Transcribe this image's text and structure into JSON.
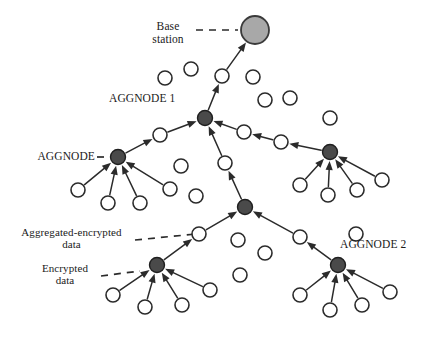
{
  "figure": {
    "type": "diagram",
    "background_color": "#ffffff",
    "stroke_color": "#2b2b2b",
    "sensor_node_fill": "#ffffff",
    "aggregator_node_fill": "#4a4a4a",
    "base_station_fill": "#a8a8a8"
  },
  "labels": {
    "base_station": {
      "line1": "Base",
      "line2": "station"
    },
    "aggnode_1": "AGGNODE 1",
    "aggnode": "AGGNODE",
    "aggnode_2": "AGGNODE 2",
    "aggregated_encrypted": {
      "line1": "Aggregated-encrypted",
      "line2": "data"
    },
    "encrypted": {
      "line1": "Encrypted",
      "line2": "data"
    }
  },
  "nodes": {
    "base_station": {
      "x": 255,
      "y": 30,
      "r": 14,
      "kind": "base-station"
    },
    "aggregators": [
      {
        "id": "aggnode1",
        "x": 205,
        "y": 118,
        "r": 7.5
      },
      {
        "id": "aggnode_left",
        "x": 118,
        "y": 157,
        "r": 7.5
      },
      {
        "id": "aggnode_right",
        "x": 330,
        "y": 152,
        "r": 7.5
      },
      {
        "id": "aggnode_center",
        "x": 245,
        "y": 207,
        "r": 7.5
      },
      {
        "id": "aggnode_bottom_left",
        "x": 157,
        "y": 265,
        "r": 7.5
      },
      {
        "id": "aggnode2",
        "x": 338,
        "y": 265,
        "r": 7.5
      }
    ],
    "relays": [
      {
        "id": "r_bs",
        "x": 222,
        "y": 76,
        "r": 7
      },
      {
        "id": "r_left_up",
        "x": 160,
        "y": 135,
        "r": 7
      },
      {
        "id": "r_right_a",
        "x": 244,
        "y": 132,
        "r": 7
      },
      {
        "id": "r_right_b",
        "x": 281,
        "y": 142,
        "r": 7
      },
      {
        "id": "r_center_up",
        "x": 225,
        "y": 163,
        "r": 7
      },
      {
        "id": "r_bl",
        "x": 199,
        "y": 234,
        "r": 7
      },
      {
        "id": "r_br",
        "x": 300,
        "y": 237,
        "r": 7
      }
    ],
    "sensors": [
      {
        "x": 165,
        "y": 78,
        "r": 7
      },
      {
        "x": 191,
        "y": 69,
        "r": 7
      },
      {
        "x": 253,
        "y": 77,
        "r": 7
      },
      {
        "x": 265,
        "y": 100,
        "r": 7
      },
      {
        "x": 290,
        "y": 98,
        "r": 7
      },
      {
        "x": 78,
        "y": 190,
        "r": 7
      },
      {
        "x": 108,
        "y": 203,
        "r": 7
      },
      {
        "x": 140,
        "y": 203,
        "r": 7
      },
      {
        "x": 170,
        "y": 189,
        "r": 7
      },
      {
        "x": 181,
        "y": 166,
        "r": 7
      },
      {
        "x": 196,
        "y": 196,
        "r": 7
      },
      {
        "x": 330,
        "y": 118,
        "r": 7
      },
      {
        "x": 300,
        "y": 185,
        "r": 7
      },
      {
        "x": 328,
        "y": 195,
        "r": 7
      },
      {
        "x": 357,
        "y": 190,
        "r": 7
      },
      {
        "x": 382,
        "y": 180,
        "r": 7
      },
      {
        "x": 238,
        "y": 240,
        "r": 7
      },
      {
        "x": 265,
        "y": 253,
        "r": 7
      },
      {
        "x": 240,
        "y": 275,
        "r": 7
      },
      {
        "x": 356,
        "y": 234,
        "r": 7
      },
      {
        "x": 113,
        "y": 295,
        "r": 7
      },
      {
        "x": 145,
        "y": 307,
        "r": 7
      },
      {
        "x": 182,
        "y": 305,
        "r": 7
      },
      {
        "x": 210,
        "y": 290,
        "r": 7
      },
      {
        "x": 300,
        "y": 295,
        "r": 7
      },
      {
        "x": 330,
        "y": 310,
        "r": 7
      },
      {
        "x": 362,
        "y": 305,
        "r": 7
      },
      {
        "x": 390,
        "y": 292,
        "r": 7
      }
    ]
  },
  "links": [
    {
      "from": [
        222,
        76
      ],
      "to": [
        255,
        30
      ],
      "arrow": true
    },
    {
      "from": [
        205,
        118
      ],
      "to": [
        222,
        76
      ],
      "arrow": true
    },
    {
      "from": [
        160,
        135
      ],
      "to": [
        205,
        118
      ],
      "arrow": true
    },
    {
      "from": [
        118,
        157
      ],
      "to": [
        160,
        135
      ],
      "arrow": true
    },
    {
      "from": [
        244,
        132
      ],
      "to": [
        205,
        118
      ],
      "arrow": true
    },
    {
      "from": [
        281,
        142
      ],
      "to": [
        244,
        132
      ],
      "arrow": true
    },
    {
      "from": [
        330,
        152
      ],
      "to": [
        281,
        142
      ],
      "arrow": true
    },
    {
      "from": [
        225,
        163
      ],
      "to": [
        205,
        118
      ],
      "arrow": true
    },
    {
      "from": [
        245,
        207
      ],
      "to": [
        225,
        163
      ],
      "arrow": true
    },
    {
      "from": [
        78,
        190
      ],
      "to": [
        118,
        157
      ],
      "arrow": true
    },
    {
      "from": [
        108,
        203
      ],
      "to": [
        118,
        157
      ],
      "arrow": true
    },
    {
      "from": [
        140,
        203
      ],
      "to": [
        118,
        157
      ],
      "arrow": true
    },
    {
      "from": [
        170,
        189
      ],
      "to": [
        118,
        157
      ],
      "arrow": true
    },
    {
      "from": [
        300,
        185
      ],
      "to": [
        330,
        152
      ],
      "arrow": true
    },
    {
      "from": [
        328,
        195
      ],
      "to": [
        330,
        152
      ],
      "arrow": true
    },
    {
      "from": [
        357,
        190
      ],
      "to": [
        330,
        152
      ],
      "arrow": true
    },
    {
      "from": [
        382,
        180
      ],
      "to": [
        330,
        152
      ],
      "arrow": true
    },
    {
      "from": [
        199,
        234
      ],
      "to": [
        245,
        207
      ],
      "arrow": true
    },
    {
      "from": [
        157,
        265
      ],
      "to": [
        199,
        234
      ],
      "arrow": true
    },
    {
      "from": [
        300,
        237
      ],
      "to": [
        245,
        207
      ],
      "arrow": true
    },
    {
      "from": [
        338,
        265
      ],
      "to": [
        300,
        237
      ],
      "arrow": true
    },
    {
      "from": [
        113,
        295
      ],
      "to": [
        157,
        265
      ],
      "arrow": true
    },
    {
      "from": [
        145,
        307
      ],
      "to": [
        157,
        265
      ],
      "arrow": true
    },
    {
      "from": [
        182,
        305
      ],
      "to": [
        157,
        265
      ],
      "arrow": true
    },
    {
      "from": [
        210,
        290
      ],
      "to": [
        157,
        265
      ],
      "arrow": true
    },
    {
      "from": [
        300,
        295
      ],
      "to": [
        338,
        265
      ],
      "arrow": true
    },
    {
      "from": [
        330,
        310
      ],
      "to": [
        338,
        265
      ],
      "arrow": true
    },
    {
      "from": [
        362,
        305
      ],
      "to": [
        338,
        265
      ],
      "arrow": true
    },
    {
      "from": [
        390,
        292
      ],
      "to": [
        338,
        265
      ],
      "arrow": true
    }
  ],
  "leader_lines": [
    {
      "id": "base-station-leader",
      "from": [
        196,
        30
      ],
      "to": [
        238,
        30
      ]
    },
    {
      "id": "aggnode-leader",
      "from": [
        97,
        157
      ],
      "to": [
        109,
        157
      ]
    },
    {
      "id": "aggregated-encrypted-leader",
      "from": [
        135,
        240
      ],
      "to": [
        196,
        234
      ]
    },
    {
      "id": "encrypted-leader",
      "from": [
        101,
        276
      ],
      "to": [
        140,
        271
      ]
    }
  ]
}
